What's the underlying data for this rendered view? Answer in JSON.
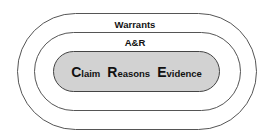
{
  "diagram": {
    "layers": [
      {
        "name": "outer",
        "label": "Warrants"
      },
      {
        "name": "middle",
        "label": "A&R"
      },
      {
        "name": "inner",
        "fill": "#d2d2d2"
      }
    ],
    "terms": [
      {
        "initial": "C",
        "rest": "laim"
      },
      {
        "initial": "R",
        "rest": "easons"
      },
      {
        "initial": "E",
        "rest": "vidence"
      }
    ]
  }
}
